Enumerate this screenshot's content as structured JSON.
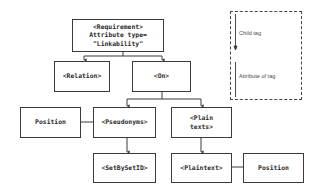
{
  "diagram": {
    "nodes": [
      {
        "id": "requirement",
        "lines": [
          "<Requirement>",
          "Attribute type=",
          "\"Linkability\""
        ]
      },
      {
        "id": "relation",
        "lines": [
          "<Relation>"
        ]
      },
      {
        "id": "on",
        "lines": [
          "<On>"
        ]
      },
      {
        "id": "position_left",
        "lines": [
          "Position"
        ]
      },
      {
        "id": "pseudonyms",
        "lines": [
          "<Pseudonyms>"
        ]
      },
      {
        "id": "plain_texts",
        "lines": [
          "<Plain",
          "texts>"
        ]
      },
      {
        "id": "setbysetid",
        "lines": [
          "<SetBySetID>"
        ]
      },
      {
        "id": "plaintext",
        "lines": [
          "<Plaintext>"
        ]
      },
      {
        "id": "position_right",
        "lines": [
          "Position"
        ]
      }
    ],
    "edges": [
      {
        "from": "requirement",
        "to": "relation",
        "type": "child"
      },
      {
        "from": "requirement",
        "to": "on",
        "type": "child"
      },
      {
        "from": "on",
        "to": "pseudonyms",
        "type": "child"
      },
      {
        "from": "on",
        "to": "plain_texts",
        "type": "child"
      },
      {
        "from": "pseudonyms",
        "to": "setbysetid",
        "type": "child"
      },
      {
        "from": "plain_texts",
        "to": "plaintext",
        "type": "child"
      },
      {
        "from": "pseudonyms",
        "to": "position_left",
        "type": "attribute"
      },
      {
        "from": "plaintext",
        "to": "position_right",
        "type": "attribute"
      }
    ]
  },
  "legend": {
    "child_label": "Child tag",
    "attribute_label": "Attribute of tag"
  },
  "colors": {
    "line": "#3a3a3a",
    "text": "#2a2a2a",
    "legend_border": "#444444"
  }
}
